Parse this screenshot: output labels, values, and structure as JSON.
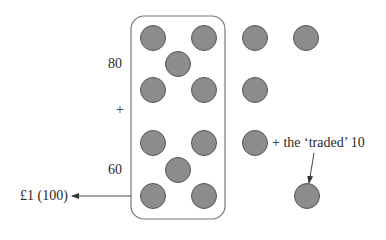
{
  "diagram": {
    "type": "place-value counters",
    "labels": {
      "eighty": "80",
      "plus": "+",
      "sixty": "60",
      "pound": "£1 (100)",
      "traded": "+ the ‘traded’ 10"
    },
    "colors": {
      "counter_fill": "#8c8c8c",
      "counter_stroke": "#555555",
      "box_stroke": "#777777",
      "arrow": "#333333"
    },
    "grouped_counters": [
      {
        "x": 153,
        "y": 38
      },
      {
        "x": 204,
        "y": 38
      },
      {
        "x": 178,
        "y": 64
      },
      {
        "x": 153,
        "y": 90
      },
      {
        "x": 204,
        "y": 90
      },
      {
        "x": 153,
        "y": 143
      },
      {
        "x": 204,
        "y": 143
      },
      {
        "x": 178,
        "y": 170
      },
      {
        "x": 153,
        "y": 196
      },
      {
        "x": 204,
        "y": 196
      }
    ],
    "remaining_counters": [
      {
        "x": 255,
        "y": 38
      },
      {
        "x": 306,
        "y": 38
      },
      {
        "x": 255,
        "y": 90
      },
      {
        "x": 255,
        "y": 143
      }
    ],
    "traded_counter": {
      "x": 307,
      "y": 196
    }
  }
}
